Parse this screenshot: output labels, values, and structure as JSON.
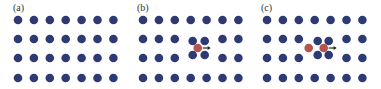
{
  "figure": {
    "colors": {
      "lattice_atom": "#2e3a73",
      "defect_atom": "#b5544a",
      "arrow": "#222222",
      "background": "#ffffff"
    },
    "panels": [
      {
        "label": "(a)",
        "description": "perfect lattice",
        "rows": 4,
        "cols": 7,
        "defect": "none"
      },
      {
        "label": "(b)",
        "description": "single interstitial with relaxed neighbors",
        "rows": 4,
        "cols": 7,
        "defect": "single",
        "defect_atoms": 1,
        "arrow_direction": "right"
      },
      {
        "label": "(c)",
        "description": "two interstitial atoms (dumbbell) with relaxed neighbors",
        "rows": 4,
        "cols": 7,
        "defect": "double",
        "defect_atoms": 2,
        "arrow_direction": "right"
      }
    ]
  }
}
